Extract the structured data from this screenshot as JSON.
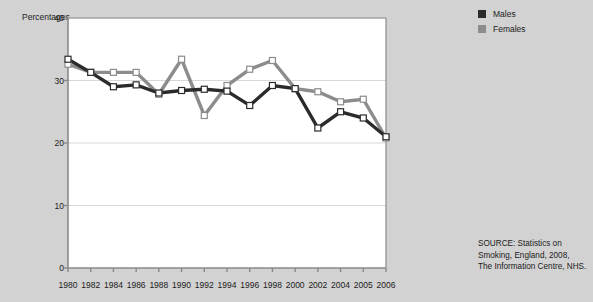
{
  "axis": {
    "y_title": "Percentages",
    "y_ticks": [
      0,
      10,
      20,
      30,
      40
    ],
    "x_ticks": [
      "1980",
      "1982",
      "1984",
      "1986",
      "1988",
      "1990",
      "1992",
      "1994",
      "1996",
      "1998",
      "2000",
      "2002",
      "2004",
      "2005",
      "2006"
    ]
  },
  "legend": {
    "position": "top-right",
    "entries": [
      {
        "label": "Males",
        "color": "#2b2b2b"
      },
      {
        "label": "Females",
        "color": "#8c8c8c"
      }
    ]
  },
  "source": {
    "line1": "SOURCE: Statistics on",
    "line2": "Smoking, England, 2008,",
    "line3": "The Information Centre, NHS."
  },
  "colors": {
    "background": "#d2d2d2",
    "plot_background": "#ffffff",
    "axis": "#8a8a8a",
    "grid": "#d8d8d8",
    "males": "#2b2b2b",
    "females": "#8c8c8c",
    "marker_fill": "#ffffff",
    "text": "#1b1b1b"
  },
  "chart_data": {
    "type": "line",
    "title": "",
    "subtitle": "",
    "xlabel": "",
    "ylabel": "Percentages",
    "categories": [
      "1980",
      "1982",
      "1984",
      "1986",
      "1988",
      "1990",
      "1992",
      "1994",
      "1996",
      "1998",
      "2000",
      "2002",
      "2004",
      "2005",
      "2006"
    ],
    "ylim": [
      0,
      40
    ],
    "yticks": [
      0,
      10,
      20,
      30,
      40
    ],
    "grid": true,
    "legend_position": "top-right",
    "series": [
      {
        "name": "Males",
        "color": "#2b2b2b",
        "values": [
          33.4,
          31.3,
          29.0,
          29.3,
          28.0,
          28.4,
          28.6,
          28.3,
          26.0,
          29.2,
          28.7,
          22.4,
          25.0,
          24.0,
          21.0
        ]
      },
      {
        "name": "Females",
        "color": "#8c8c8c",
        "values": [
          32.6,
          31.3,
          31.3,
          31.3,
          27.8,
          33.4,
          24.4,
          29.2,
          31.8,
          33.2,
          28.7,
          28.2,
          26.6,
          27.0,
          20.8
        ]
      }
    ]
  }
}
